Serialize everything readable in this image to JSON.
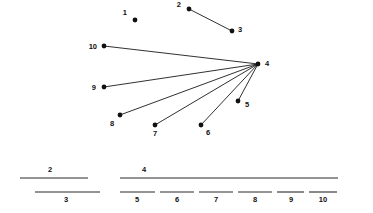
{
  "figure": {
    "width": 373,
    "height": 213,
    "background_color": "#ffffff",
    "ink_color": "#111111"
  },
  "chart_data": {
    "type": "diagram",
    "subtype": "node-link-graph",
    "title": "",
    "xlabel": "",
    "ylabel": "",
    "grid": false,
    "legend": null,
    "axis_visible": false,
    "nodes": [
      {
        "id": "1",
        "label": "1",
        "x": 135,
        "y": 20,
        "label_x": 127,
        "label_y": 15,
        "label_anchor": "end"
      },
      {
        "id": "2",
        "label": "2",
        "x": 189,
        "y": 9,
        "label_x": 181,
        "label_y": 7,
        "label_anchor": "end"
      },
      {
        "id": "3",
        "label": "3",
        "x": 232,
        "y": 31,
        "label_x": 238,
        "label_y": 32,
        "label_anchor": "start"
      },
      {
        "id": "4",
        "label": "4",
        "x": 258,
        "y": 64,
        "label_x": 265,
        "label_y": 66,
        "label_anchor": "start"
      },
      {
        "id": "5",
        "label": "5",
        "x": 238,
        "y": 101,
        "label_x": 245,
        "label_y": 107,
        "label_anchor": "start"
      },
      {
        "id": "6",
        "label": "6",
        "x": 201,
        "y": 125,
        "label_x": 206,
        "label_y": 135,
        "label_anchor": "start"
      },
      {
        "id": "7",
        "label": "7",
        "x": 155,
        "y": 125,
        "label_x": 155,
        "label_y": 136,
        "label_anchor": "middle"
      },
      {
        "id": "8",
        "label": "8",
        "x": 120,
        "y": 115,
        "label_x": 112,
        "label_y": 126,
        "label_anchor": "middle"
      },
      {
        "id": "9",
        "label": "9",
        "x": 104,
        "y": 87,
        "label_x": 96,
        "label_y": 90,
        "label_anchor": "end"
      },
      {
        "id": "10",
        "label": "10",
        "x": 104,
        "y": 46,
        "label_x": 97,
        "label_y": 49,
        "label_anchor": "end"
      }
    ],
    "node_radius": 2.4,
    "edges": [
      {
        "source": "2",
        "target": "3"
      },
      {
        "source": "4",
        "target": "5"
      },
      {
        "source": "4",
        "target": "6"
      },
      {
        "source": "4",
        "target": "7"
      },
      {
        "source": "4",
        "target": "8"
      },
      {
        "source": "4",
        "target": "9"
      },
      {
        "source": "4",
        "target": "10"
      }
    ],
    "isolated_nodes": [
      "1"
    ],
    "components": [
      {
        "name": "isolated",
        "members": [
          "1"
        ]
      },
      {
        "name": "edge",
        "members": [
          "2",
          "3"
        ]
      },
      {
        "name": "star",
        "hub": "4",
        "members": [
          "4",
          "5",
          "6",
          "7",
          "8",
          "9",
          "10"
        ]
      }
    ],
    "segments": [
      {
        "label": "2",
        "x1": 20,
        "x2": 88,
        "y": 178,
        "label_x": 50,
        "label_y": 172,
        "label_position": "above",
        "row": "upper"
      },
      {
        "label": "4",
        "x1": 120,
        "x2": 338,
        "y": 178,
        "label_x": 144,
        "label_y": 172,
        "label_position": "above",
        "row": "upper"
      },
      {
        "label": "3",
        "x1": 35,
        "x2": 100,
        "y": 192,
        "label_x": 66,
        "label_y": 202,
        "label_position": "below",
        "row": "lower"
      },
      {
        "label": "5",
        "x1": 120,
        "x2": 155,
        "y": 192,
        "label_x": 137,
        "label_y": 202,
        "label_position": "below",
        "row": "lower"
      },
      {
        "label": "6",
        "x1": 160,
        "x2": 194,
        "y": 192,
        "label_x": 177,
        "label_y": 202,
        "label_position": "below",
        "row": "lower"
      },
      {
        "label": "7",
        "x1": 199,
        "x2": 233,
        "y": 192,
        "label_x": 216,
        "label_y": 202,
        "label_position": "below",
        "row": "lower"
      },
      {
        "label": "8",
        "x1": 238,
        "x2": 272,
        "y": 192,
        "label_x": 255,
        "label_y": 202,
        "label_position": "below",
        "row": "lower"
      },
      {
        "label": "9",
        "x1": 277,
        "x2": 304,
        "y": 192,
        "label_x": 291,
        "label_y": 202,
        "label_position": "below",
        "row": "lower"
      },
      {
        "label": "10",
        "x1": 309,
        "x2": 337,
        "y": 192,
        "label_x": 323,
        "label_y": 202,
        "label_position": "below",
        "row": "lower"
      }
    ]
  }
}
